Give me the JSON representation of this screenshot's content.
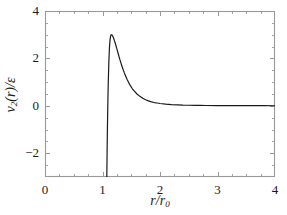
{
  "chart_data": {
    "type": "line",
    "title": "",
    "xlabel": "r/r0",
    "xlabel_parts": {
      "num": "r",
      "den": "r",
      "den_sub": "0"
    },
    "ylabel": "v2(r)/ε",
    "ylabel_parts": {
      "v": "v",
      "v_sub": "2",
      "arg": "(r)",
      "slash": "/",
      "eps": "ε"
    },
    "xlim": [
      0,
      4
    ],
    "ylim": [
      -3,
      4
    ],
    "xticks": [
      0,
      1,
      2,
      3,
      4
    ],
    "xtick_labels": [
      "0",
      "1",
      "2",
      "3",
      "4"
    ],
    "yticks": [
      -2,
      0,
      2,
      4
    ],
    "ytick_labels": [
      "−2",
      "0",
      "2",
      "4"
    ],
    "xminor_step": 0.25,
    "yminor_step": 0.5,
    "grid": false,
    "legend": null,
    "line_color": "#1a1a1a",
    "line_width": 1.2,
    "axis_color": "#999999",
    "background": "#ffffff",
    "annotations": [
      {
        "text": "peak",
        "x": 1.25,
        "y": 3.0
      },
      {
        "text": "divergence",
        "x": 1.08,
        "y": -3.0
      },
      {
        "text": "asymptote",
        "x": 4.0,
        "y": 0.0
      }
    ],
    "series": [
      {
        "name": "v2(r)/ε",
        "x": [
          1.075,
          1.08,
          1.085,
          1.09,
          1.095,
          1.1,
          1.11,
          1.12,
          1.13,
          1.14,
          1.15,
          1.165,
          1.18,
          1.195,
          1.21,
          1.225,
          1.24,
          1.255,
          1.27,
          1.285,
          1.3,
          1.32,
          1.34,
          1.36,
          1.38,
          1.4,
          1.43,
          1.46,
          1.49,
          1.52,
          1.55,
          1.6,
          1.65,
          1.7,
          1.75,
          1.8,
          1.85,
          1.9,
          1.95,
          2.0,
          2.1,
          2.2,
          2.3,
          2.4,
          2.5,
          2.6,
          2.7,
          2.8,
          3.0,
          3.2,
          3.4,
          3.6,
          3.8,
          4.0
        ],
        "y": [
          -3.0,
          -1.95,
          -1.05,
          -0.28,
          0.38,
          0.95,
          1.83,
          2.42,
          2.76,
          2.93,
          3.0,
          2.99,
          2.93,
          2.84,
          2.73,
          2.62,
          2.49,
          2.36,
          2.23,
          2.1,
          1.97,
          1.81,
          1.66,
          1.52,
          1.39,
          1.27,
          1.1,
          0.96,
          0.83,
          0.72,
          0.63,
          0.5,
          0.4,
          0.32,
          0.26,
          0.21,
          0.17,
          0.14,
          0.12,
          0.1,
          0.07,
          0.05,
          0.04,
          0.03,
          0.025,
          0.02,
          0.018,
          0.015,
          0.012,
          0.01,
          0.008,
          0.007,
          0.006,
          0.005
        ]
      }
    ]
  },
  "axes": {
    "plot_box": {
      "left": 45,
      "top": 11,
      "right": 275,
      "bottom": 177
    }
  }
}
